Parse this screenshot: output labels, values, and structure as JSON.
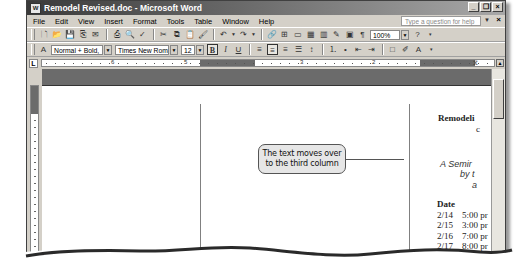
{
  "window": {
    "title": "Remodel Revised.doc - Microsoft Word",
    "controls": [
      "minimize",
      "restore",
      "close"
    ]
  },
  "menubar": {
    "items": [
      {
        "label": "File"
      },
      {
        "label": "Edit"
      },
      {
        "label": "View"
      },
      {
        "label": "Insert"
      },
      {
        "label": "Format"
      },
      {
        "label": "Tools"
      },
      {
        "label": "Table"
      },
      {
        "label": "Window"
      },
      {
        "label": "Help"
      }
    ],
    "help_placeholder": "Type a question for help"
  },
  "standard_toolbar": {
    "icons": [
      "new-icon",
      "open-icon",
      "save-icon",
      "permission-icon",
      "email-icon",
      "print-icon",
      "print-preview-icon",
      "spelling-icon",
      "cut-icon",
      "copy-icon",
      "paste-icon",
      "format-painter-icon",
      "undo-icon",
      "redo-icon",
      "hyperlink-icon",
      "tables-borders-icon",
      "insert-table-icon",
      "excel-icon",
      "columns-icon",
      "drawing-icon",
      "document-map-icon",
      "show-hide-icon",
      "help-icon"
    ],
    "zoom": "100%"
  },
  "formatting_toolbar": {
    "style": "Normal + Bold,",
    "font": "Times New Roman",
    "size": "12",
    "bold_label": "B",
    "italic_label": "I",
    "underline_label": "U"
  },
  "ruler": {
    "numbers": [
      "6",
      "5",
      "3",
      "2"
    ]
  },
  "document": {
    "title": "Remodeli",
    "title_line2": "c",
    "subtitle": [
      "A Semir",
      "by t",
      "a"
    ],
    "schedule_header": "Date",
    "schedule": [
      {
        "date": "2/14",
        "time": "5:00 pr"
      },
      {
        "date": "2/15",
        "time": "3:00 pr"
      },
      {
        "date": "2/16",
        "time": "7:00 pr"
      },
      {
        "date": "2/17",
        "time": "8:00 pr"
      },
      {
        "date": "2/18",
        "time": "3:00 pr"
      }
    ]
  },
  "callout": {
    "line1": "The text moves over",
    "line2": "to the third column"
  }
}
